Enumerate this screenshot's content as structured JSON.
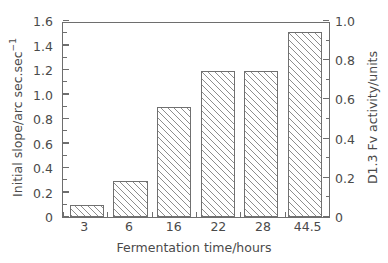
{
  "chart_data": {
    "type": "bar",
    "title": "",
    "subtitle": "",
    "categories": [
      "3",
      "6",
      "16",
      "22",
      "28",
      "44.5"
    ],
    "values": [
      0.1,
      0.29,
      0.9,
      1.19,
      1.19,
      1.51
    ],
    "xlabel": "Fermentation time/hours",
    "ylabel": "Initial slope/arc sec.sec",
    "ylabel_superscript": "−1",
    "ylabel_full": "Initial slope/arc sec.sec⁻¹",
    "ylim": [
      0,
      1.6
    ],
    "yticks": [
      "0",
      "0.2",
      "0.4",
      "0.6",
      "0.8",
      "1.0",
      "1.2",
      "1.4",
      "1.6"
    ],
    "ytick_values": [
      0,
      0.2,
      0.4,
      0.6,
      0.8,
      1.0,
      1.2,
      1.4,
      1.6
    ],
    "secondary_axis": {
      "label": "D1.3 Fv activity/units",
      "ylim": [
        0,
        1.0
      ],
      "yticks": [
        "0",
        "0.2",
        "0.4",
        "0.6",
        "0.8",
        "1.0"
      ],
      "ytick_values": [
        0,
        0.2,
        0.4,
        0.6,
        0.8,
        1.0
      ],
      "values": [
        0.0667,
        0.1933,
        0.6,
        0.7933,
        0.7933,
        1.0067
      ]
    },
    "grid": false,
    "legend": null,
    "bar_fill": "#ffffff",
    "bar_hatch": "forward-diagonal",
    "bar_edge_color": "#707070",
    "hatch_color": "#8d8d8d",
    "axis_color": "#6e6e6e",
    "text_color": "#4a4a4a",
    "background": "#ffffff"
  }
}
